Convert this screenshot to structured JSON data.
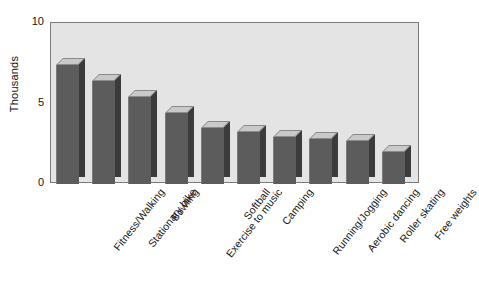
{
  "chart_data": {
    "type": "bar",
    "title": "",
    "subtitle": "",
    "xlabel": "",
    "ylabel": "Thousands",
    "ylim": [
      0,
      10
    ],
    "yticks": [
      0,
      5,
      10
    ],
    "ytick_labels": [
      "0",
      "5",
      "10"
    ],
    "grid": false,
    "legend": null,
    "style": "3d-bars-grayscale",
    "categories": [
      "Fitness/Walking",
      "Stationary bike",
      "Bowling",
      "Exercise to music",
      "Softball",
      "Camping",
      "Running/Jogging",
      "Aerobic dancing",
      "Roller skating",
      "Free weights"
    ],
    "values": [
      7.4,
      6.4,
      5.4,
      4.4,
      3.5,
      3.2,
      2.9,
      2.8,
      2.7,
      2.0
    ],
    "colors": {
      "bar_face": "#5c5c5c",
      "bar_side": "#3b3b3b",
      "bar_top": "#c9c9c9",
      "plot_background": "#e4e4e4",
      "frame": "#7c7c7c",
      "text": "#141414",
      "page_background": "#ffffff"
    }
  },
  "axis": {
    "y_title": "Thousands",
    "y_tick_top": "10",
    "y_tick_mid": "5",
    "y_tick_zero": "0"
  }
}
